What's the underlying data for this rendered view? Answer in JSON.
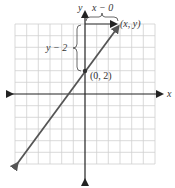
{
  "diagram": {
    "type": "coordinate-plane",
    "axes": {
      "x_label": "x",
      "y_label": "y"
    },
    "grid": {
      "cells_x": 12,
      "cells_y": 12,
      "color": "#cfcfcf"
    },
    "line": {
      "color": "#555555",
      "through": [
        0,
        2
      ],
      "slope": 1.333
    },
    "points": [
      {
        "label": "(0, 2)",
        "x": 0,
        "y": 2
      },
      {
        "label": "(x, y)",
        "x": 3,
        "y": 6
      }
    ],
    "annotations": {
      "horizontal_brace": "x − 0",
      "vertical_brace": "y − 2"
    },
    "colors": {
      "axis": "#222222",
      "line": "#555555",
      "grid": "#cfcfcf",
      "brace": "#444444"
    }
  }
}
